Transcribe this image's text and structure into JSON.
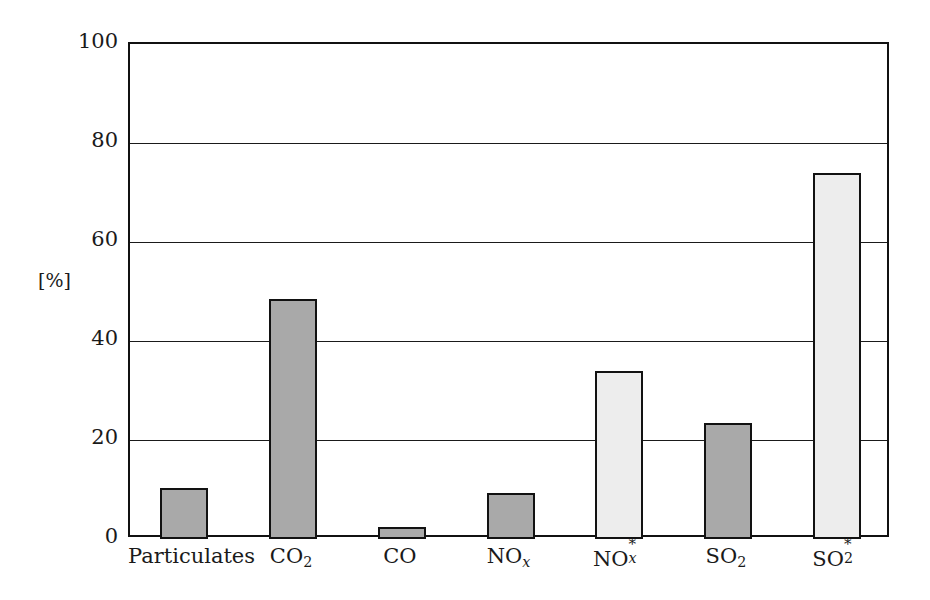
{
  "chart_data": {
    "type": "bar",
    "title": "",
    "xlabel": "",
    "ylabel": "[%]",
    "ylim": [
      0,
      100
    ],
    "yticks": [
      0,
      20,
      40,
      60,
      80,
      100
    ],
    "grid": true,
    "legend": "none",
    "categories": [
      "Particulates",
      "CO2",
      "CO",
      "NOx",
      "NOx*",
      "SO2",
      "SO2*"
    ],
    "category_labels_display": [
      "Particulates",
      "CO₂",
      "NOₓ",
      "NOₓ*",
      "SO₂",
      "SO₂*"
    ],
    "values": [
      10.4,
      48.5,
      2.4,
      9.3,
      34.0,
      23.5,
      74.0
    ],
    "bar_fills": [
      "dark",
      "dark",
      "dark",
      "dark",
      "light",
      "dark",
      "light"
    ],
    "colors": {
      "dark_fill": "#a9a9a9",
      "light_fill": "#ededed",
      "bar_edge": "#121212",
      "axis": "#111111",
      "gridline": "#1a1a1a",
      "background": "#ffffff",
      "text": "#1a1a1a"
    }
  },
  "axes": {
    "y_unit_label": "[%]",
    "y_tick_labels": [
      "100",
      "80",
      "60",
      "40",
      "20",
      "0"
    ]
  },
  "bars": [
    {
      "key": "particulates",
      "value": 10.4,
      "fill": "dark",
      "label_text": "Particulates",
      "label_base": "Particulates",
      "sub": "",
      "sup": ""
    },
    {
      "key": "co2",
      "value": 48.5,
      "fill": "dark",
      "label_text": "CO₂",
      "label_base": "CO",
      "sub": "2",
      "sup": ""
    },
    {
      "key": "co",
      "value": 2.4,
      "fill": "dark",
      "label_text": "CO",
      "label_base": "CO",
      "sub": "",
      "sup": ""
    },
    {
      "key": "nox",
      "value": 9.3,
      "fill": "dark",
      "label_text": "NOx",
      "label_base": "NO",
      "sub": "x",
      "sup": ""
    },
    {
      "key": "nox-star",
      "value": 34.0,
      "fill": "light",
      "label_text": "NOx*",
      "label_base": "NO",
      "sub": "x",
      "sup": "*"
    },
    {
      "key": "so2",
      "value": 23.5,
      "fill": "dark",
      "label_text": "SO₂",
      "label_base": "SO",
      "sub": "2",
      "sup": ""
    },
    {
      "key": "so2-star",
      "value": 74.0,
      "fill": "light",
      "label_text": "SO₂*",
      "label_base": "SO",
      "sub": "2",
      "sup": "*"
    }
  ]
}
